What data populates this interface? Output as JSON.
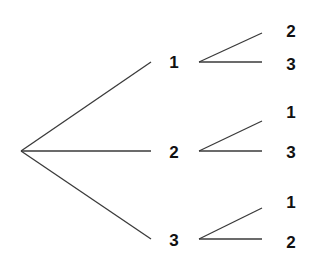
{
  "diagram": {
    "type": "tree",
    "root": {
      "x": 21,
      "y": 151
    },
    "level1": [
      {
        "label": "1",
        "end": {
          "x": 151,
          "y": 62
        },
        "label_pos": {
          "x": 174,
          "y": 62
        },
        "branch_start": {
          "x": 199,
          "y": 62
        },
        "children": [
          {
            "label": "2",
            "end": {
              "x": 262,
              "y": 33
            },
            "label_pos": {
              "x": 291,
              "y": 31
            }
          },
          {
            "label": "3",
            "end": {
              "x": 262,
              "y": 62
            },
            "label_pos": {
              "x": 291,
              "y": 64
            }
          }
        ]
      },
      {
        "label": "2",
        "end": {
          "x": 151,
          "y": 151
        },
        "label_pos": {
          "x": 174,
          "y": 152
        },
        "branch_start": {
          "x": 199,
          "y": 151
        },
        "children": [
          {
            "label": "1",
            "end": {
              "x": 262,
              "y": 121
            },
            "label_pos": {
              "x": 291,
              "y": 112
            }
          },
          {
            "label": "3",
            "end": {
              "x": 262,
              "y": 151
            },
            "label_pos": {
              "x": 291,
              "y": 152
            }
          }
        ]
      },
      {
        "label": "3",
        "end": {
          "x": 151,
          "y": 239
        },
        "label_pos": {
          "x": 174,
          "y": 240
        },
        "branch_start": {
          "x": 199,
          "y": 239
        },
        "children": [
          {
            "label": "1",
            "end": {
              "x": 262,
              "y": 208
            },
            "label_pos": {
              "x": 291,
              "y": 202
            }
          },
          {
            "label": "2",
            "end": {
              "x": 262,
              "y": 239
            },
            "label_pos": {
              "x": 291,
              "y": 242
            }
          }
        ]
      }
    ]
  }
}
